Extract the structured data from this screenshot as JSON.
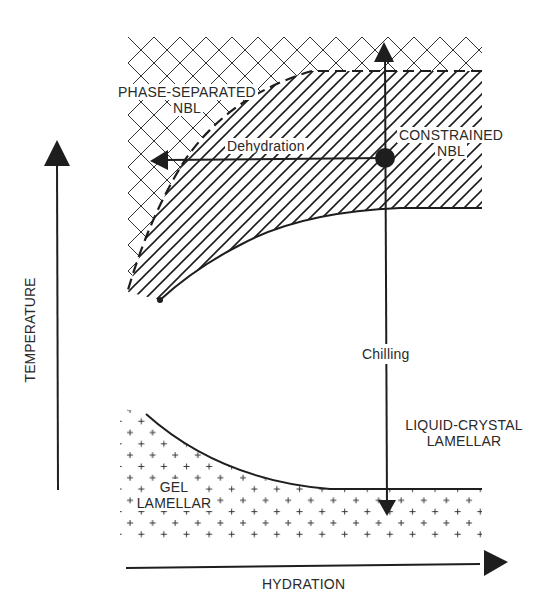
{
  "diagram": {
    "type": "phase-diagram",
    "axes": {
      "x_label": "HYDRATION",
      "y_label": "TEMPERATURE"
    },
    "regions": {
      "phase_separated": {
        "line1": "PHASE-SEPARATED",
        "line2": "NBL",
        "pattern": "crosshatch"
      },
      "constrained": {
        "line1": "CONSTRAINED",
        "line2": "NBL",
        "pattern": "diagonal-hatch"
      },
      "liquid_crystal": {
        "line1": "LIQUID-CRYSTAL",
        "line2": "LAMELLAR",
        "pattern": "none"
      },
      "gel": {
        "line1": "GEL",
        "line2": "LAMELLAR",
        "pattern": "plus-dots"
      }
    },
    "arrows": {
      "dehydration": "Dehydration",
      "chilling": "Chilling"
    },
    "colors": {
      "ink": "#1e1e1e",
      "background": "#ffffff"
    }
  }
}
